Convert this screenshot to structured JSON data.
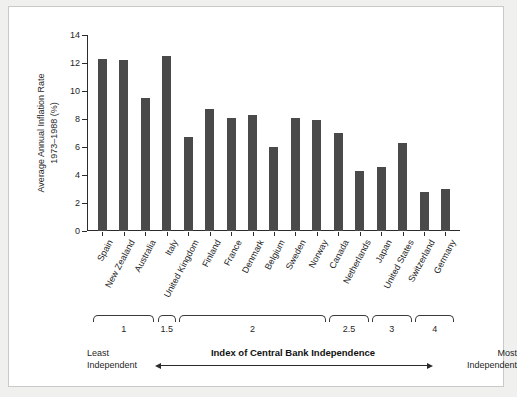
{
  "chart_data": {
    "type": "bar",
    "title": "",
    "xlabel": "Index of Central Bank Independence",
    "ylabel": "Average Annual Inflation Rate 1973–1988 (%)",
    "ylabel_line1": "Average Annual Inflation Rate",
    "ylabel_line2": "1973–1988 (%)",
    "categories": [
      "Spain",
      "New Zealand",
      "Australia",
      "Italy",
      "United Kingdom",
      "Finland",
      "France",
      "Denmark",
      "Belgium",
      "Sweden",
      "Norway",
      "Canada",
      "Netherlands",
      "Japan",
      "United States",
      "Switzerland",
      "Germany"
    ],
    "values": [
      12.3,
      12.2,
      9.5,
      12.5,
      6.7,
      8.7,
      8.1,
      8.3,
      6.0,
      8.1,
      7.9,
      7.0,
      4.3,
      4.6,
      6.3,
      2.8,
      3.0
    ],
    "ylim": [
      0,
      14
    ],
    "yticks": [
      0,
      2,
      4,
      6,
      8,
      10,
      12,
      14
    ],
    "ytick_labels": [
      "0",
      "2",
      "4",
      "6",
      "8",
      "10",
      "12",
      "14"
    ],
    "grid": false,
    "legend": "none",
    "bar_color": "#4a4a4a",
    "axis_color": "#2b2b2b",
    "index_groups": [
      {
        "label": "1",
        "first": 0,
        "last": 2
      },
      {
        "label": "1.5",
        "first": 3,
        "last": 3
      },
      {
        "label": "2",
        "first": 4,
        "last": 10
      },
      {
        "label": "2.5",
        "first": 11,
        "last": 12
      },
      {
        "label": "3",
        "first": 13,
        "last": 14
      },
      {
        "label": "4",
        "first": 15,
        "last": 16
      }
    ],
    "annotations": {
      "left_end_line1": "Least",
      "left_end_line2": "Independent",
      "right_end_line1": "Most",
      "right_end_line2": "Independent"
    }
  }
}
